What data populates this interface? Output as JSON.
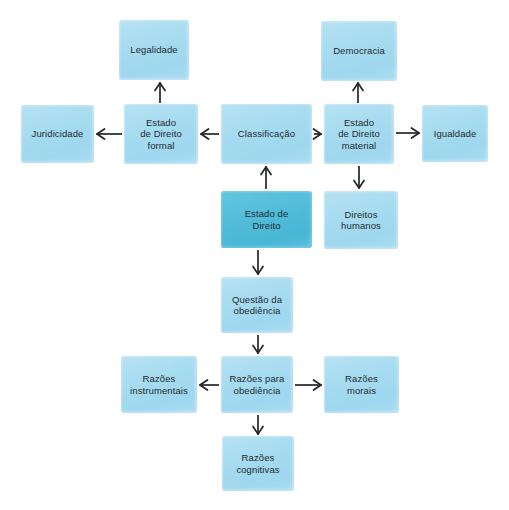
{
  "diagram": {
    "background_color": "#ffffff",
    "node_color": "#a9dcf1",
    "accent_color": "#57bfdb",
    "text_color": "#1f2a2e",
    "arrow_color": "#22262b",
    "nodes": [
      {
        "id": "legalidade",
        "label": "Legalidade",
        "style": "light",
        "x": 119,
        "y": 20,
        "w": 70,
        "h": 60
      },
      {
        "id": "democracia",
        "label": "Democracia",
        "style": "light",
        "x": 321,
        "y": 21,
        "w": 76,
        "h": 60
      },
      {
        "id": "juridicidade",
        "label": "Juridicidade",
        "style": "light",
        "x": 21,
        "y": 105,
        "w": 73,
        "h": 58
      },
      {
        "id": "ed-formal",
        "label": "Estado\nde Direito\nformal",
        "style": "light",
        "x": 124,
        "y": 104,
        "w": 74,
        "h": 60
      },
      {
        "id": "classificacao",
        "label": "Classificação",
        "style": "light",
        "x": 221,
        "y": 104,
        "w": 91,
        "h": 60
      },
      {
        "id": "ed-material",
        "label": "Estado\nde Direito\nmaterial",
        "style": "light",
        "x": 324,
        "y": 104,
        "w": 70,
        "h": 60
      },
      {
        "id": "igualdade",
        "label": "Igualdade",
        "style": "light",
        "x": 422,
        "y": 105,
        "w": 66,
        "h": 57
      },
      {
        "id": "estado-direito",
        "label": "Estado de\nDireito",
        "style": "accent",
        "x": 221,
        "y": 191,
        "w": 91,
        "h": 57
      },
      {
        "id": "direitos-humanos",
        "label": "Direitos\nhumanos",
        "style": "light",
        "x": 324,
        "y": 191,
        "w": 74,
        "h": 58
      },
      {
        "id": "questao",
        "label": "Questão da\nobediência",
        "style": "light",
        "x": 221,
        "y": 277,
        "w": 72,
        "h": 56
      },
      {
        "id": "razoes-instr",
        "label": "Razões\ninstrumentais",
        "style": "light",
        "x": 121,
        "y": 356,
        "w": 76,
        "h": 57
      },
      {
        "id": "razoes-para",
        "label": "Razões para\nobediência",
        "style": "light",
        "x": 221,
        "y": 356,
        "w": 72,
        "h": 57
      },
      {
        "id": "razoes-morais",
        "label": "Razões\nmorais",
        "style": "light",
        "x": 324,
        "y": 356,
        "w": 75,
        "h": 57
      },
      {
        "id": "razoes-cogn",
        "label": "Razões\ncognitivas",
        "style": "light",
        "x": 222,
        "y": 436,
        "w": 72,
        "h": 55
      }
    ],
    "edges": [
      {
        "id": "edge-ed-formal-to-legalidade",
        "from": "ed-formal",
        "to": "legalidade",
        "direction": "up",
        "x1": 160,
        "y1": 103,
        "x2": 160,
        "y2": 83
      },
      {
        "id": "edge-ed-material-to-democracia",
        "from": "ed-material",
        "to": "democracia",
        "direction": "up",
        "x1": 358,
        "y1": 103,
        "x2": 358,
        "y2": 83
      },
      {
        "id": "edge-ed-formal-to-juridicidade",
        "from": "ed-formal",
        "to": "juridicidade",
        "direction": "left",
        "x1": 122,
        "y1": 134,
        "x2": 97,
        "y2": 134
      },
      {
        "id": "edge-classificacao-to-ed-formal",
        "from": "classificacao",
        "to": "ed-formal",
        "direction": "left",
        "x1": 219,
        "y1": 134,
        "x2": 201,
        "y2": 134
      },
      {
        "id": "edge-classificacao-to-ed-material",
        "from": "classificacao",
        "to": "ed-material",
        "direction": "right",
        "x1": 314,
        "y1": 134,
        "x2": 321,
        "y2": 134
      },
      {
        "id": "edge-ed-material-to-igualdade",
        "from": "ed-material",
        "to": "igualdade",
        "direction": "right",
        "x1": 396,
        "y1": 133,
        "x2": 419,
        "y2": 133
      },
      {
        "id": "edge-estado-to-classificacao",
        "from": "estado-direito",
        "to": "classificacao",
        "direction": "up",
        "x1": 266,
        "y1": 189,
        "x2": 266,
        "y2": 167
      },
      {
        "id": "edge-ed-material-to-direitos",
        "from": "ed-material",
        "to": "direitos-humanos",
        "direction": "down",
        "x1": 359,
        "y1": 166,
        "x2": 359,
        "y2": 188
      },
      {
        "id": "edge-estado-to-questao",
        "from": "estado-direito",
        "to": "questao",
        "direction": "down",
        "x1": 258,
        "y1": 250,
        "x2": 258,
        "y2": 274
      },
      {
        "id": "edge-questao-to-razoes-para",
        "from": "questao",
        "to": "razoes-para",
        "direction": "down",
        "x1": 258,
        "y1": 335,
        "x2": 258,
        "y2": 353
      },
      {
        "id": "edge-razoes-para-to-instr",
        "from": "razoes-para",
        "to": "razoes-instr",
        "direction": "left",
        "x1": 219,
        "y1": 385,
        "x2": 200,
        "y2": 385
      },
      {
        "id": "edge-razoes-para-to-morais",
        "from": "razoes-para",
        "to": "razoes-morais",
        "direction": "right",
        "x1": 295,
        "y1": 385,
        "x2": 321,
        "y2": 385
      },
      {
        "id": "edge-razoes-para-to-cogn",
        "from": "razoes-para",
        "to": "razoes-cogn",
        "direction": "down",
        "x1": 258,
        "y1": 415,
        "x2": 258,
        "y2": 434
      }
    ]
  }
}
